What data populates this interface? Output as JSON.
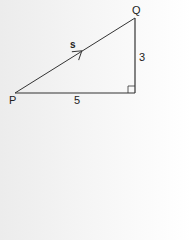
{
  "diagram": {
    "type": "right-triangle-vector",
    "vertices": {
      "P": {
        "label": "P"
      },
      "Q": {
        "label": "Q"
      }
    },
    "vector_label": "s",
    "sides": {
      "horizontal": "5",
      "vertical": "3"
    },
    "right_angle_marker": true,
    "colors": {
      "line": "#333333",
      "text": "#222222"
    }
  }
}
